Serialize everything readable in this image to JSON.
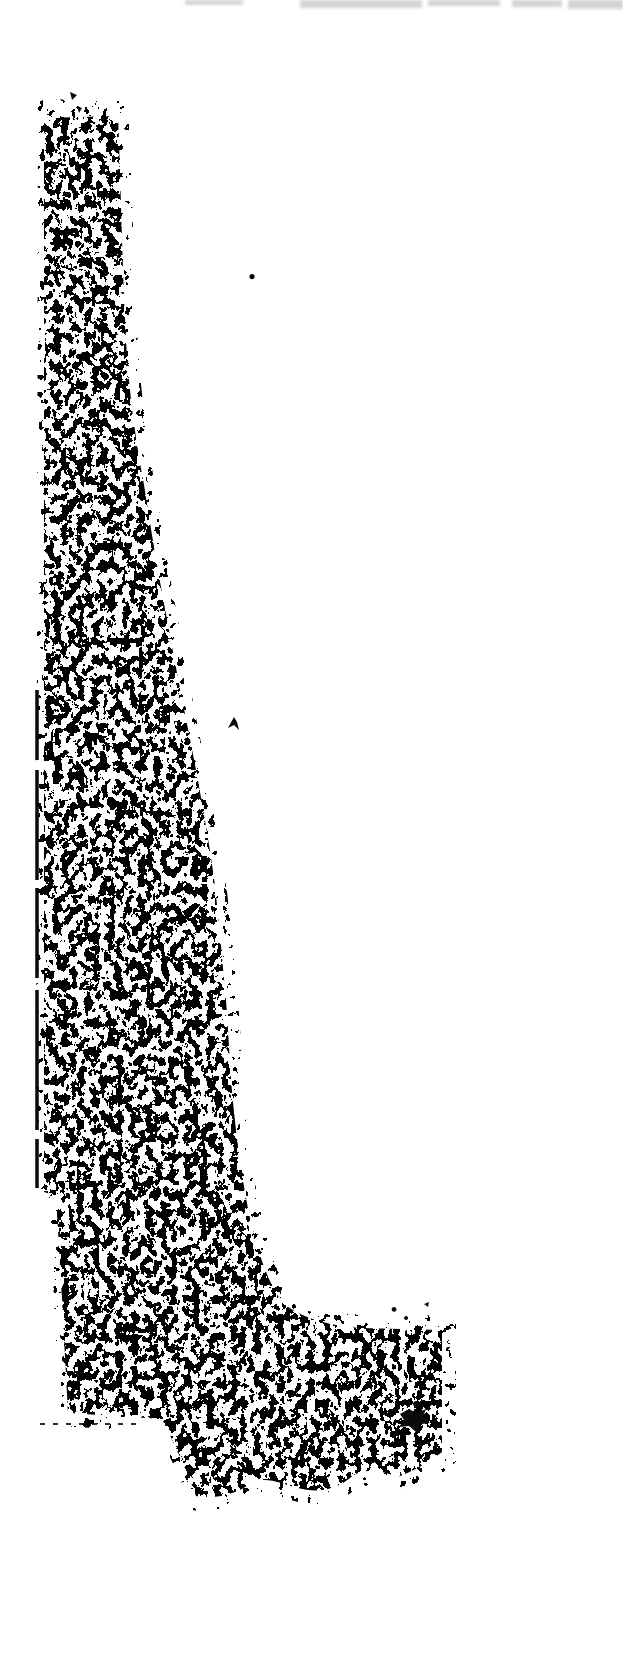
{
  "colors": {
    "background": "#ffffff",
    "ink": "#0a0a0a",
    "smudge": "#c6c6c6"
  },
  "noise": {
    "type": "binary-speckle",
    "base_frequency": "0.13 0.105",
    "octaves": 3,
    "seed_main": 11,
    "seed_halo": 29,
    "matrix_main": "0 0 0 0 0  0 0 0 0 0  0 0 0 0 0  2 2 2 0 -2.55",
    "matrix_halo": "0 0 0 0 0  0 0 0 0 0  0 0 0 0 0  2 2 2 0 -3.1",
    "threshold_table": "0 1"
  },
  "shapes": {
    "blob_path": "M44,118 L118,116 C121,190 122,255 125,320 C128,392 136,440 144,485 C151,530 158,572 166,614 C174,658 182,700 191,744 C200,790 208,835 214,878 C219,920 222,958 226,1000 C229,1040 230,1075 234,1112 C238,1150 243,1185 250,1218 C257,1248 266,1280 282,1302 C300,1318 330,1326 360,1328 L442,1330 L442,1452 C424,1466 410,1472 398,1477 C380,1470 362,1468 350,1478 C334,1491 316,1493 298,1488 C280,1483 264,1475 250,1484 C236,1494 214,1500 196,1496 C187,1471 175,1445 162,1419 L68,1413 L62,1300 L56,1196 L44,1192 Z",
    "halo_path": "M38,100 L128,98 C132,190 134,260 137,330 C141,402 149,452 157,497 C164,542 171,584 179,626 C187,670 195,714 204,758 C213,804 221,849 227,892 C232,934 235,972 239,1014 C242,1054 243,1089 247,1126 C251,1164 257,1198 265,1228 C272,1258 283,1288 296,1306 C312,1316 336,1312 362,1314 L456,1316 L456,1462 C436,1480 418,1486 400,1492 C382,1484 364,1482 352,1492 C336,1505 316,1507 298,1502 C280,1497 264,1489 250,1498 C236,1508 212,1514 192,1510 C183,1484 171,1457 156,1432 L60,1426 L54,1300 L48,1194 L36,1190 Z",
    "smudge_path": "M185,0 L243,0 L243,5 L185,5 Z M300,0 L422,0 L422,8 L300,8 Z M428,0 L500,0 L500,6 L428,6 Z M512,0 L562,0 L562,7 L512,7 Z M568,0 L623,0 L623,9 L568,9 Z",
    "left_rule_path": "M37,690 L37,1188",
    "ledge_path": "M40,1424 L138,1424",
    "cluster_path": "M400,1414 l9,-5 7,4 10,-4 -3,8 7,6 -9,1 -5,8 -7,-6 -10,1 5,-7 z M416,1401 a3,3 0 1 0 0.1,0 z",
    "marks_path": "M70,92 l7,3 -5,5 z M77,106 l5,2 -3,5 z M252,274 a2.6,2.6 0 1 0 0.1,0 z M228,728 l6,-11 3,5 2,8 -5,-5 z M394,1307 a2.4,2.4 0 1 0 0.1,0 z M406,1316 a2,2 0 1 0 0.1,0 z M424,1304 l5,-2 -1,5 z"
  }
}
